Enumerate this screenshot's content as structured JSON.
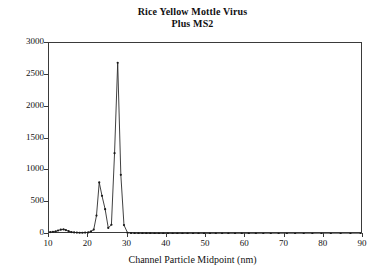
{
  "chart_data": {
    "type": "line",
    "title": "Rice Yellow Mottle Virus Plus MS2",
    "title_lines": [
      "Rice Yellow Mottle Virus",
      "Plus MS2"
    ],
    "xlabel": "Channel Particle Midpoint (nm)",
    "ylabel": "",
    "xlim": [
      10,
      90
    ],
    "ylim": [
      0,
      3000
    ],
    "grid": false,
    "legend": null,
    "markers": "dot",
    "line_color": "#2b2b2b",
    "marker_color": "#1a1a1a",
    "frame_color": "#3a3a3a",
    "background": "#ffffff",
    "xticks": [
      10,
      20,
      30,
      40,
      50,
      60,
      70,
      80,
      90
    ],
    "xtick_labels": [
      "10",
      "20",
      "30",
      "40",
      "50",
      "60",
      "70",
      "80",
      "90"
    ],
    "yticks": [
      0,
      500,
      1000,
      1500,
      2000,
      2500,
      3000
    ],
    "ytick_labels": [
      "0",
      "500",
      "1000",
      "1500",
      "2000",
      "2500",
      "3000"
    ],
    "series": [
      {
        "name": "Particle count",
        "x": [
          10.3,
          11.0,
          11.7,
          12.3,
          13.0,
          13.7,
          14.3,
          15.0,
          15.7,
          16.4,
          17.1,
          17.8,
          18.5,
          19.2,
          20.0,
          20.7,
          21.4,
          22.1,
          22.8,
          23.5,
          24.3,
          25.1,
          25.9,
          26.7,
          27.5,
          28.3,
          29.1,
          30.0,
          30.9,
          31.8,
          32.8,
          33.8,
          34.8,
          35.8,
          36.9,
          38.0,
          39.1,
          40.3,
          41.5,
          42.7,
          44.0,
          45.3,
          46.7,
          48.1,
          49.5,
          51.0,
          52.5,
          54.1,
          55.7,
          57.4,
          59.1,
          60.9,
          62.7,
          64.6,
          66.5,
          68.5,
          70.6,
          72.7,
          74.9,
          77.1,
          79.4,
          81.8,
          84.3,
          86.8,
          89.4
        ],
        "values": [
          30,
          35,
          40,
          55,
          68,
          72,
          62,
          45,
          30,
          25,
          22,
          20,
          20,
          22,
          25,
          40,
          70,
          290,
          810,
          600,
          390,
          95,
          145,
          1270,
          2690,
          930,
          140,
          20,
          15,
          12,
          10,
          10,
          9,
          9,
          8,
          8,
          8,
          7,
          7,
          7,
          7,
          6,
          6,
          6,
          6,
          6,
          5,
          5,
          5,
          5,
          5,
          5,
          5,
          4,
          4,
          4,
          4,
          4,
          4,
          4,
          3,
          3,
          3,
          3,
          3
        ]
      }
    ],
    "peaks": [
      {
        "label": "MS2 peak",
        "x": 22.8,
        "y": 810
      },
      {
        "label": "RYMV peak",
        "x": 27.5,
        "y": 2690
      }
    ]
  }
}
